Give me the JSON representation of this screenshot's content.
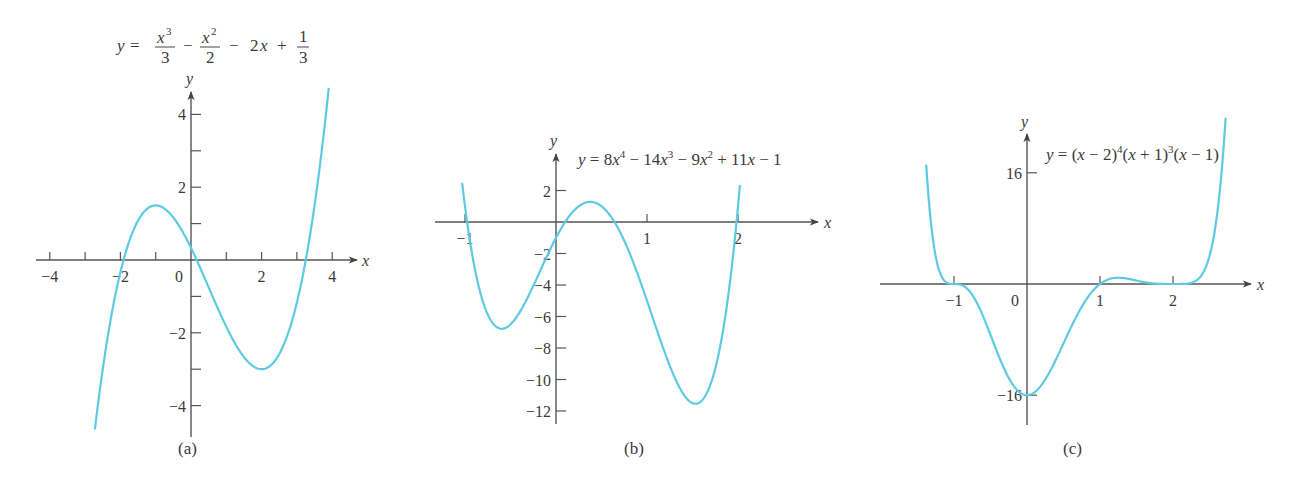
{
  "chart_data": [
    {
      "type": "line",
      "panel": "(a)",
      "title": "y = x^3/3 - x^2/2 - 2x + 1/3",
      "equation": {
        "lhs": "y =",
        "terms": [
          {
            "num": "x3",
            "den": "3"
          },
          {
            "op": "−"
          },
          {
            "num": "x2",
            "den": "2"
          },
          {
            "op": "− 2x +"
          },
          {
            "num": "1",
            "den": "3"
          }
        ]
      },
      "xlabel": "x",
      "ylabel": "y",
      "xlim": [
        -4.3,
        4.6
      ],
      "ylim": [
        -4.8,
        4.7
      ],
      "xticks": [
        -4,
        -3,
        -2,
        -1,
        0,
        1,
        2,
        3,
        4
      ],
      "xtick_labels": [
        "−4",
        "",
        "−2",
        "",
        "0",
        "",
        "2",
        "",
        "4"
      ],
      "yticks": [
        -4,
        -3,
        -2,
        -1,
        1,
        2,
        3,
        4
      ],
      "ytick_labels": [
        "−4",
        "",
        "−2",
        "",
        "",
        "2",
        "",
        "4"
      ],
      "x_range_drawn": [
        -2.72,
        3.9
      ],
      "coefficients_desc": [
        0.3333,
        -0.5,
        -2,
        0.3333
      ],
      "key_points": [
        {
          "x": -1,
          "y": 1.5,
          "note": "local max"
        },
        {
          "x": 2,
          "y": -3,
          "note": "local min"
        }
      ],
      "caption": "(a)"
    },
    {
      "type": "line",
      "panel": "(b)",
      "title": "y = 8x^4 − 14x^3 − 9x^2 + 11x − 1",
      "equation_text": "y = 8x4 − 14x3 − 9x2 + 11x − 1",
      "xlabel": "x",
      "ylabel": "y",
      "xlim": [
        -1.33,
        2.89
      ],
      "ylim": [
        -13.2,
        4.3
      ],
      "xticks": [
        -1,
        1,
        2
      ],
      "xtick_labels": [
        "−1",
        "1",
        "2"
      ],
      "yticks": [
        2,
        -2,
        -4,
        -6,
        -8,
        -10,
        -12
      ],
      "ytick_labels": [
        "2",
        "−2",
        "−4",
        "−6",
        "−8",
        "−10",
        "−12"
      ],
      "x_range_drawn": [
        -1.03,
        2.02
      ],
      "coefficients_desc": [
        8,
        -14,
        -9,
        11,
        -1
      ],
      "key_points": [
        {
          "x": -0.5,
          "y": -6.6,
          "note": "local min"
        },
        {
          "x": 0.4,
          "y": 1.3,
          "note": "local max"
        },
        {
          "x": 1.6,
          "y": -11.3,
          "note": "local min"
        }
      ],
      "caption": "(b)"
    },
    {
      "type": "line",
      "panel": "(c)",
      "title": "y = (x − 2)^4 (x + 1)^3 (x − 1)",
      "equation_text": "y = (x − 2)4(x + 1)3(x − 1)",
      "xlabel": "x",
      "ylabel": "y",
      "xlim": [
        -2.0,
        3.1
      ],
      "ylim": [
        -20,
        21
      ],
      "xticks": [
        -1,
        1,
        2
      ],
      "xtick_labels": [
        "−1",
        "1",
        "2"
      ],
      "x_zero_label": "0",
      "yticks": [
        16,
        -16
      ],
      "ytick_labels": [
        "16",
        "−16"
      ],
      "x_range_drawn": [
        -1.38,
        2.72
      ],
      "roots": [
        -1,
        1,
        2
      ],
      "key_points": [
        {
          "x": 0,
          "y": -16,
          "note": "local min"
        },
        {
          "x": 1.25,
          "y": 0.4,
          "note": "small local max"
        }
      ],
      "caption": "(c)"
    }
  ],
  "style": {
    "curve_color": "#5ccbe2",
    "axis_color": "#555555",
    "text_color": "#3a3a3a"
  }
}
